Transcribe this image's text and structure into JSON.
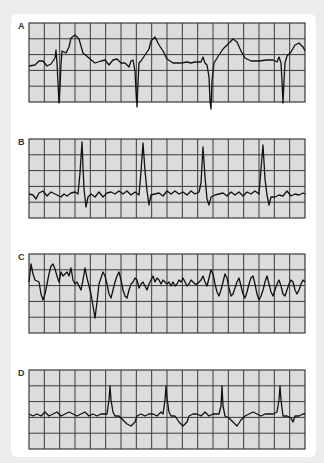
{
  "figure": {
    "background_color": "#ececec",
    "card_color": "#ffffff",
    "grid_fill": "#dcdcdc",
    "grid_line": "#3a3a3a",
    "trace_color": "#111111",
    "grid": {
      "columns": 18,
      "rows": 5,
      "width": 276,
      "height": 79
    },
    "strips": [
      {
        "label": "A",
        "top": 23,
        "points": "0,43 6,42 10,38 14,38 18,43 22,41 26,35 27,27 28,40 29,60 30,80 31,64 32,42 33,28 37,30 40,24 42,15 46,12 50,16 52,23 54,30 60,35 66,40 72,38 76,37 80,42 84,37 88,36 92,40 96,40 100,44 102,38 104,37 106,48 107,68 108,84 109,60 110,40 112,38 116,32 120,26 122,18 126,14 130,22 134,28 138,36 144,40 152,40 158,39 162,40 166,39 172,39 174,34 176,40 178,42 180,54 181,78 182,86 183,58 185,40 190,32 194,26 200,20 204,16 208,19 212,28 216,35 222,38 230,38 238,37 244,37 248,39 250,34 252,40 253,58 254,80 255,58 256,40 258,33 262,29 266,22 270,20 274,24 276,28"
      },
      {
        "label": "B",
        "top": 139,
        "points": "0,55 4,56 7,60 10,54 14,52 18,57 22,53 28,56 32,58 35,55 38,57 42,54 46,53 49,55 51,34 53,3 54,28 55,50 57,68 59,58 62,55 66,58 70,53 74,58 78,54 82,53 86,55 90,52 94,55 98,52 102,56 106,53 110,56 112,33 114,4 116,32 118,52 120,66 122,56 126,55 130,54 134,57 138,52 142,55 146,52 150,55 154,53 158,56 162,52 166,55 170,53 172,44 174,8 176,38 178,60 180,66 182,58 186,56 190,55 194,54 198,57 202,53 206,56 210,53 214,57 218,53 222,55 226,52 230,55 232,30 234,6 236,40 238,56 240,66 242,58 246,58 250,56 254,57 258,52 262,57 266,55 270,56 274,54 276,55"
      },
      {
        "label": "C",
        "top": 254,
        "points": "0,28 2,10 4,20 6,26 10,28 12,40 14,46 16,40 18,30 20,20 22,12 24,10 26,15 28,22 30,28 32,18 34,22 36,20 38,18 40,22 42,14 44,26 46,30 48,28 50,32 52,36 54,26 56,14 58,24 60,32 62,40 64,52 66,64 68,48 70,30 72,24 74,18 76,22 78,30 80,40 82,44 84,36 86,28 88,22 90,18 92,26 94,36 96,42 98,44 100,36 102,30 104,28 106,24 108,26 110,34 112,30 114,28 116,32 118,36 120,30 122,26 124,22 126,28 128,24 130,26 132,30 134,26 136,28 138,30 140,28 142,32 144,28 146,32 148,30 150,26 152,28 154,24 156,28 158,32 160,30 162,26 164,28 166,30 168,30 170,28 172,26 174,22 176,28 178,32 180,24 182,16 184,20 186,30 188,38 190,42 192,36 194,28 196,20 198,24 200,34 202,42 204,40 206,34 208,28 210,24 212,32 214,40 216,44 218,38 220,30 222,24 224,22 226,30 228,40 230,46 232,42 234,36 236,28 238,22 240,30 242,38 244,42 246,36 248,30 250,26 252,32 254,40 256,42 258,36 260,30 262,26 264,28 266,36 268,40 270,36 272,30 274,26 276,28"
      },
      {
        "label": "D",
        "top": 370,
        "points": "0,44 4,46 8,44 12,46 16,42 20,46 24,44 28,42 32,46 36,44 40,42 44,44 48,46 52,44 56,42 60,46 64,44 68,46 72,44 76,44 78,44 80,30 81,16 82,30 84,42 86,46 90,46 94,50 98,54 102,56 106,52 108,46 112,44 116,46 120,44 124,44 128,46 132,42 134,44 136,30 137,16 138,28 140,42 142,46 146,46 150,52 154,56 158,52 160,46 164,44 168,44 172,46 176,42 180,46 184,44 188,44 190,44 192,36 193,16 194,36 196,46 200,48 204,52 208,56 212,50 216,46 220,44 224,42 228,44 232,46 236,44 240,44 244,44 248,42 250,30 251,16 252,30 254,46 258,46 262,48 264,52 266,46 270,46 274,44 276,44"
      }
    ]
  }
}
